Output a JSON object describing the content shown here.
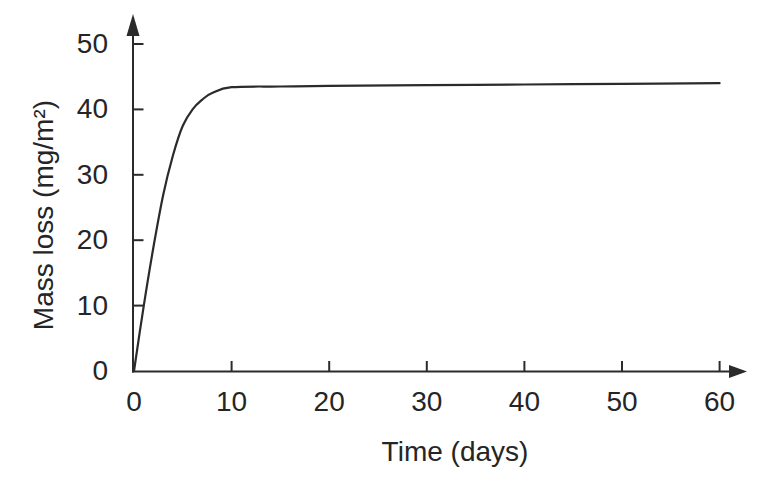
{
  "page": {
    "background": "#ffffff"
  },
  "chart_data": {
    "type": "line",
    "title": "",
    "xlabel": "Time (days)",
    "ylabel": "Mass loss (mg/m²)",
    "xlim": [
      0,
      60
    ],
    "ylim": [
      0,
      50
    ],
    "x_ticks": [
      0,
      10,
      20,
      30,
      40,
      50,
      60
    ],
    "y_ticks": [
      0,
      10,
      20,
      30,
      40,
      50
    ],
    "grid": false,
    "legend": false,
    "axis_arrows": true,
    "tick_direction": "in",
    "line_color": "#2b2b2b",
    "text_color": "#252525",
    "series": [
      {
        "name": "mass-loss",
        "x": [
          0,
          1,
          2,
          3,
          4,
          5,
          6,
          7,
          8,
          10,
          15,
          20,
          30,
          40,
          50,
          60
        ],
        "y": [
          0,
          10,
          19,
          27,
          33,
          37.5,
          40,
          41.5,
          42.5,
          43.4,
          43.5,
          43.6,
          43.7,
          43.8,
          43.9,
          44
        ]
      }
    ]
  }
}
